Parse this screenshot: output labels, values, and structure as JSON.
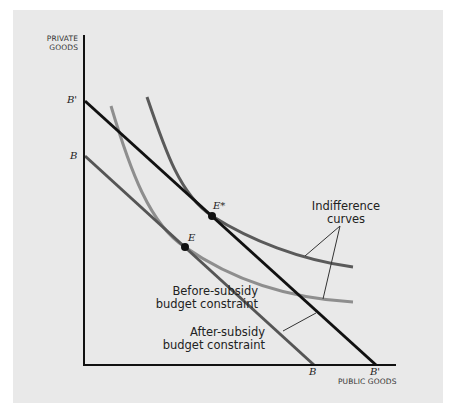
{
  "diagram": {
    "y_axis_title_line1": "PRIVATE",
    "y_axis_title_line2": "GOODS",
    "x_axis_title": "PUBLIC GOODS",
    "y_intercept_after": "B'",
    "y_intercept_before": "B",
    "x_intercept_before": "B",
    "x_intercept_after": "B'",
    "point_after": "E*",
    "point_before": "E",
    "indifference_label_line1": "Indifference",
    "indifference_label_line2": "curves",
    "before_label_line1": "Before-subsidy",
    "before_label_line2": "budget constraint",
    "after_label_line1": "After-subsidy",
    "after_label_line2": "budget constraint",
    "colors": {
      "background": "#e9e9e9",
      "after_budget_line": "#111111",
      "before_budget_line": "#555555",
      "high_indifference_curve": "#5a5a5a",
      "low_indifference_curve": "#8e8e8e",
      "axes": "#111111"
    }
  }
}
